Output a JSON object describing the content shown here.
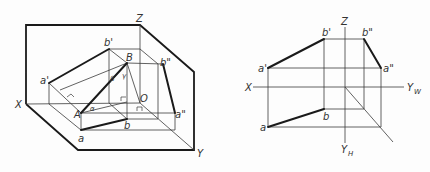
{
  "figure_left": {
    "title": "Axonometric view of line AB in three projection planes",
    "axis_labels": {
      "x": "X",
      "y": "Y",
      "z": "Z",
      "origin": "O"
    },
    "points": {
      "A": "A",
      "B": "B",
      "a": "a",
      "b": "b",
      "a_prime": "a'",
      "b_prime": "b'",
      "a_double_prime": "a\"",
      "b_double_prime": "b\""
    },
    "angles": {
      "alpha": "α",
      "beta": "β",
      "gamma": "γ"
    }
  },
  "figure_right": {
    "title": "Orthographic projection of line AB",
    "axis_labels": {
      "x": "X",
      "z": "Z",
      "yw": "Y",
      "yw_sub": "W",
      "yh": "Y",
      "yh_sub": "H"
    },
    "points": {
      "a": "a",
      "b": "b",
      "a_prime": "a'",
      "b_prime": "b'",
      "a_double_prime": "a\"",
      "b_double_prime": "b\""
    }
  },
  "colors": {
    "line": "#3a3a3a",
    "thick_line": "#1a1a1a",
    "background": "#fdfdfd"
  }
}
